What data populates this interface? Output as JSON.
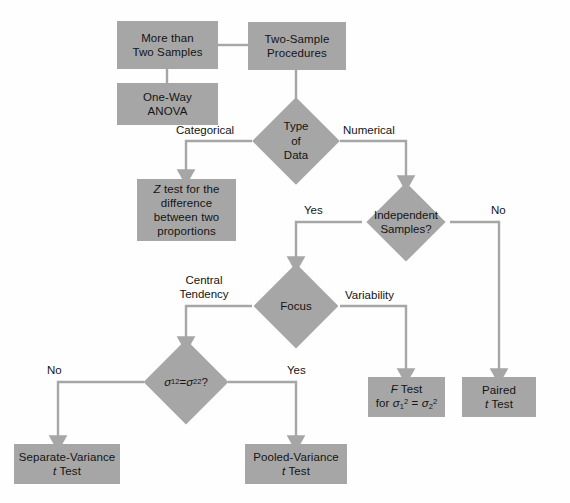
{
  "diagram": {
    "palette": {
      "node_fill": "#a6a6a6",
      "wire": "#a6a6a6",
      "text": "#141414",
      "background": "#fefefe"
    },
    "nodes": {
      "more_than_two_samples": {
        "label": "More than\nTwo Samples",
        "shape": "box"
      },
      "one_way_anova": {
        "label": "One-Way\nANOVA",
        "shape": "box"
      },
      "two_sample_procedures": {
        "label": "Two-Sample\nProcedures",
        "shape": "box"
      },
      "type_of_data": {
        "label": "Type\nof\nData",
        "shape": "diamond"
      },
      "z_test": {
        "label": "Z test for the\ndifference\nbetween two\nproportions",
        "shape": "box"
      },
      "independent_samples": {
        "label": "Independent\nSamples?",
        "shape": "diamond"
      },
      "focus": {
        "label": "Focus",
        "shape": "diamond"
      },
      "variance_equal": {
        "label": "σ1² = σ2²?",
        "shape": "diamond"
      },
      "f_test": {
        "label": "F Test\nfor σ1² = σ2²",
        "shape": "box"
      },
      "paired_t_test": {
        "label": "Paired\nt Test",
        "shape": "box"
      },
      "separate_variance_t_test": {
        "label": "Separate-Variance\nt Test",
        "shape": "box"
      },
      "pooled_variance_t_test": {
        "label": "Pooled-Variance\nt Test",
        "shape": "box"
      }
    },
    "edge_labels": {
      "categorical": "Categorical",
      "numerical": "Numerical",
      "yes_independent": "Yes",
      "no_independent": "No",
      "central_tendency": "Central\nTendency",
      "variability": "Variability",
      "no_variance": "No",
      "yes_variance": "Yes"
    }
  }
}
